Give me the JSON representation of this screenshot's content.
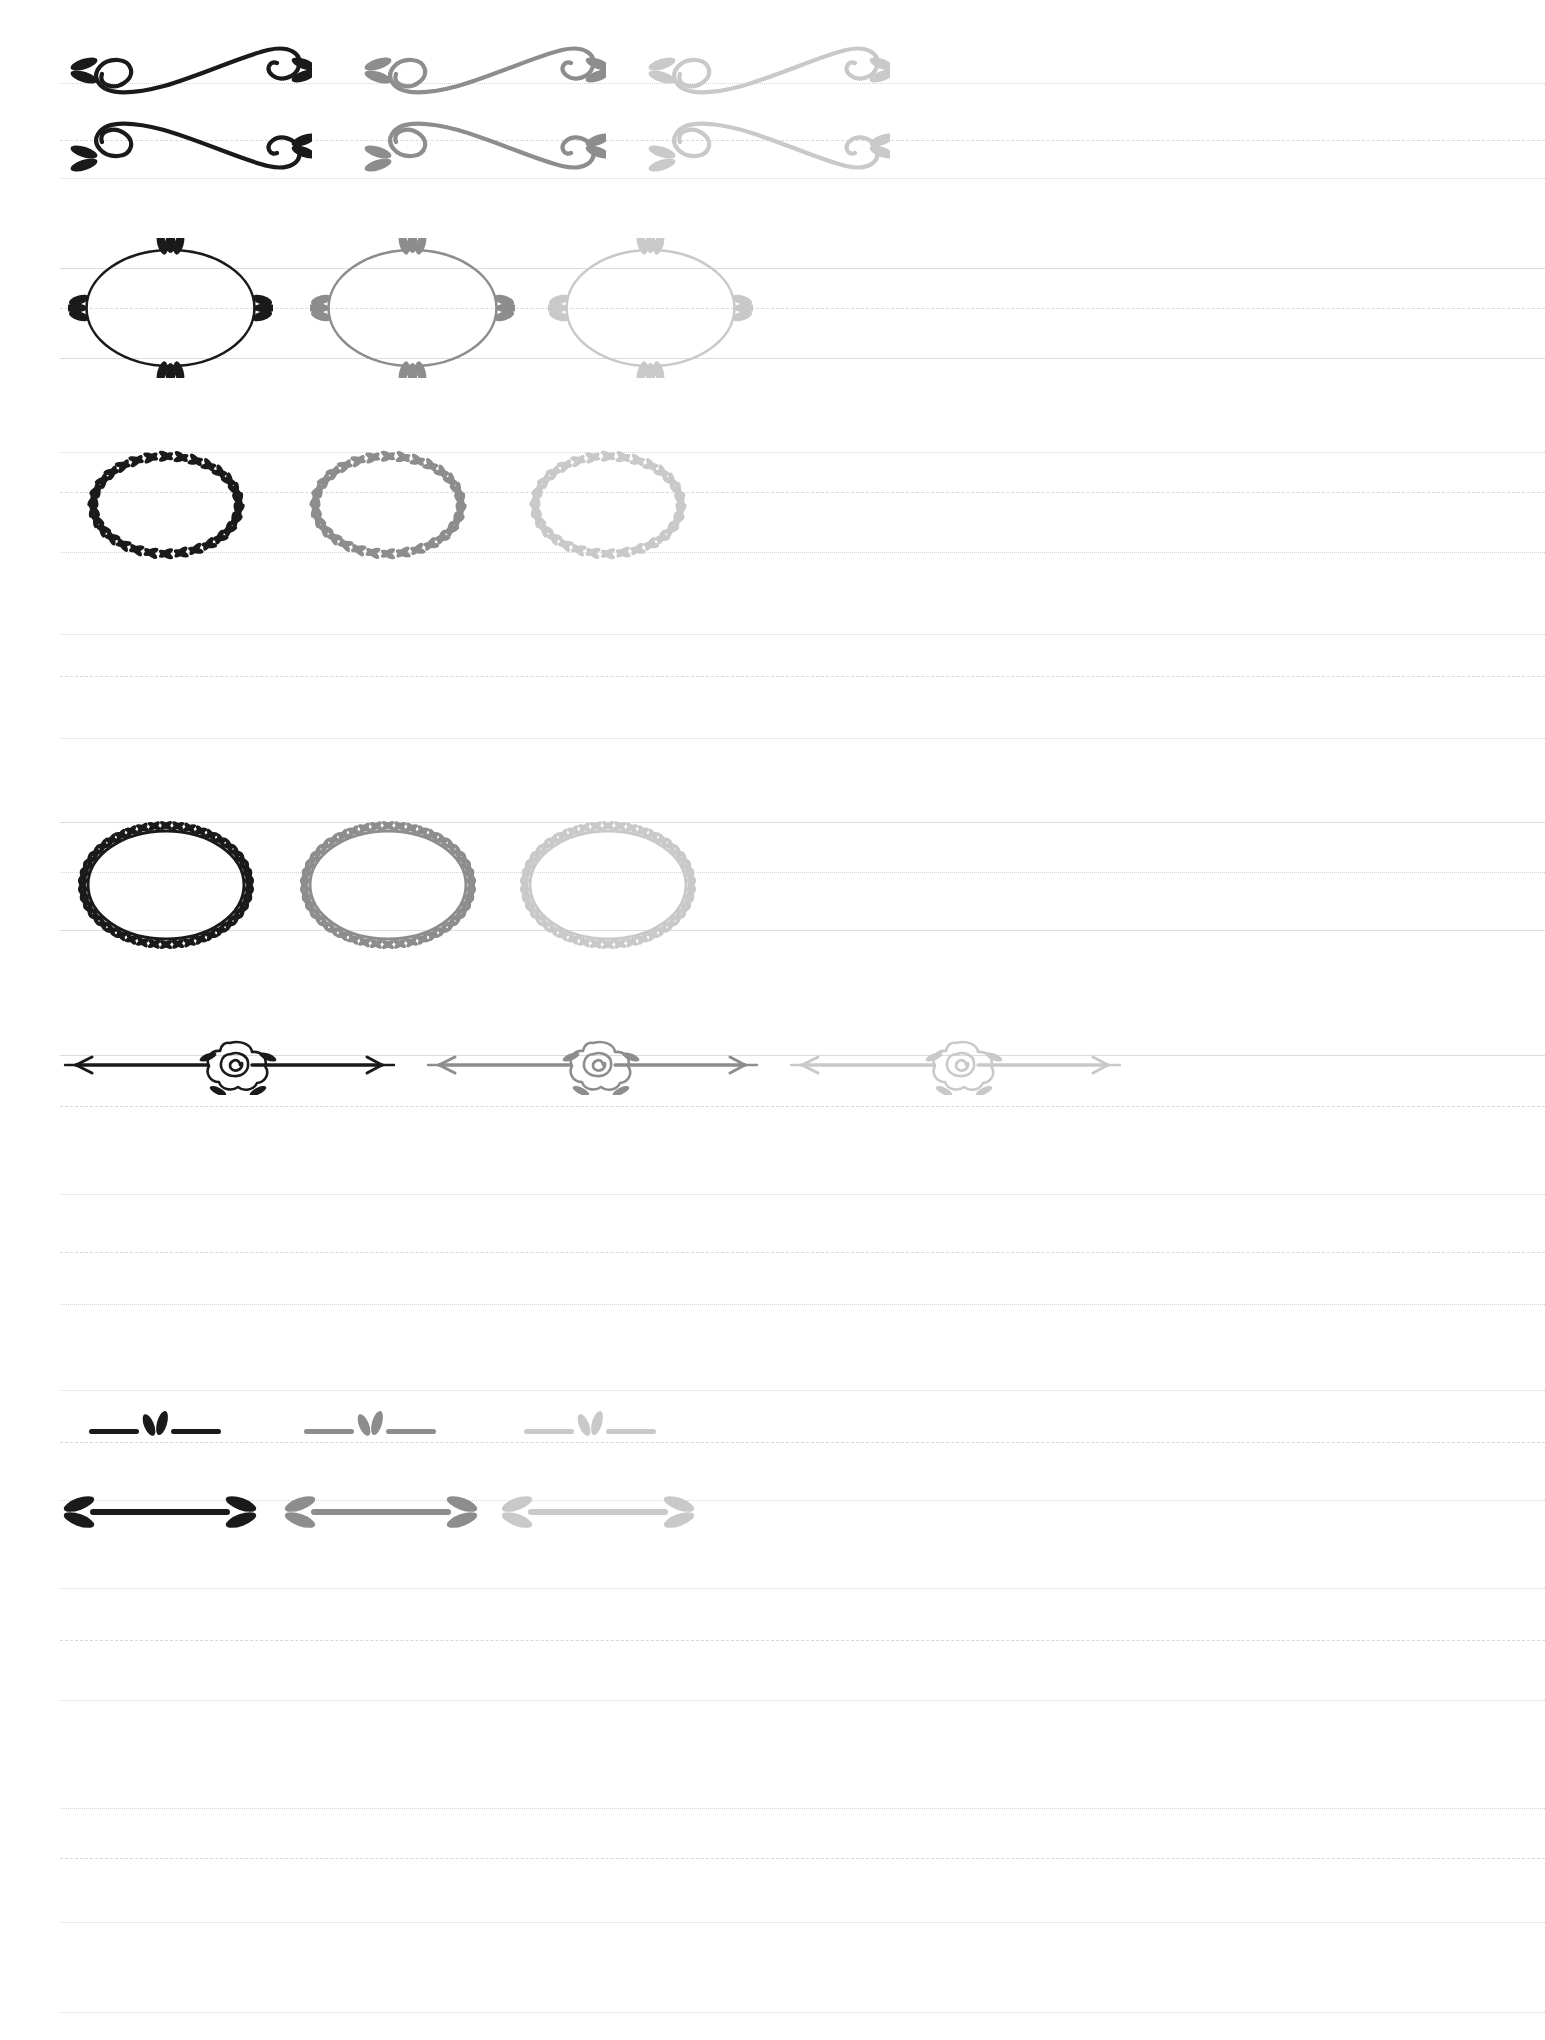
{
  "page": {
    "background_color": "#ffffff",
    "width": 1545,
    "height": 2040,
    "kind": "ornament-specimen-sheet"
  },
  "tones": {
    "dark": "#1a1a1a",
    "mid": "#8d8d8d",
    "light": "#c9c9c9",
    "tone_labels": [
      "dark",
      "mid",
      "light"
    ]
  },
  "ruled_lines": {
    "solid_color": "#dcdcdc",
    "dashed_color": "#d8d8d8",
    "dotted_color": "#d5d5d5",
    "left_margin": 60,
    "rows": [
      {
        "y": 83,
        "style": "dotted"
      },
      {
        "y": 140,
        "style": "dashed"
      },
      {
        "y": 178,
        "style": "dotted"
      },
      {
        "y": 268,
        "style": "solid"
      },
      {
        "y": 308,
        "style": "dashed"
      },
      {
        "y": 358,
        "style": "solid"
      },
      {
        "y": 452,
        "style": "dotted"
      },
      {
        "y": 492,
        "style": "dashed"
      },
      {
        "y": 552,
        "style": "dotted"
      },
      {
        "y": 634,
        "style": "dotted"
      },
      {
        "y": 676,
        "style": "dashed"
      },
      {
        "y": 738,
        "style": "dotted"
      },
      {
        "y": 822,
        "style": "solid"
      },
      {
        "y": 872,
        "style": "dotted"
      },
      {
        "y": 930,
        "style": "solid"
      },
      {
        "y": 1055,
        "style": "solid"
      },
      {
        "y": 1106,
        "style": "dashed"
      },
      {
        "y": 1194,
        "style": "dotted"
      },
      {
        "y": 1252,
        "style": "dashed"
      },
      {
        "y": 1304,
        "style": "dotted"
      },
      {
        "y": 1390,
        "style": "dotted"
      },
      {
        "y": 1442,
        "style": "dashed"
      },
      {
        "y": 1500,
        "style": "dotted"
      },
      {
        "y": 1588,
        "style": "dotted"
      },
      {
        "y": 1640,
        "style": "dashed"
      },
      {
        "y": 1700,
        "style": "dotted"
      },
      {
        "y": 1808,
        "style": "dotted"
      },
      {
        "y": 1858,
        "style": "dashed"
      },
      {
        "y": 1922,
        "style": "dotted"
      },
      {
        "y": 2012,
        "style": "dotted"
      }
    ]
  },
  "ornaments": [
    {
      "id": "swash-flourish-1",
      "name": "leafed-swash-flourish",
      "description": "S-curve calligraphic swash with leaf sprigs at both ends, left curl up",
      "row": 1,
      "y": 28,
      "variants": [
        {
          "tone": "dark",
          "x": 62,
          "width": 250,
          "height": 70
        },
        {
          "tone": "mid",
          "x": 356,
          "width": 250,
          "height": 70
        },
        {
          "tone": "light",
          "x": 640,
          "width": 250,
          "height": 70
        }
      ]
    },
    {
      "id": "swash-flourish-2",
      "name": "leafed-swash-flourish-mirrored",
      "description": "S-curve calligraphic swash mirrored vertically, leaf sprigs both ends",
      "row": 2,
      "y": 118,
      "variants": [
        {
          "tone": "dark",
          "x": 62,
          "width": 250,
          "height": 70
        },
        {
          "tone": "mid",
          "x": 356,
          "width": 250,
          "height": 70
        },
        {
          "tone": "light",
          "x": 640,
          "width": 250,
          "height": 70
        }
      ]
    },
    {
      "id": "oval-frame-leaf-tips",
      "name": "oval-frame-with-leaf-tips",
      "description": "Plain thin oval outline frame with three-leaf sprigs at top, bottom, left and right",
      "row": 3,
      "y": 238,
      "variants": [
        {
          "tone": "dark",
          "x": 68,
          "width": 205,
          "height": 140
        },
        {
          "tone": "mid",
          "x": 310,
          "width": 205,
          "height": 140
        },
        {
          "tone": "light",
          "x": 548,
          "width": 205,
          "height": 140
        }
      ]
    },
    {
      "id": "laurel-oval-sparse",
      "name": "laurel-wreath-oval-sparse",
      "description": "Open oval wreath of loose paired leaves, sparse spacing, no connecting stem",
      "row": 4,
      "y": 440,
      "variants": [
        {
          "tone": "dark",
          "x": 66,
          "width": 200,
          "height": 130
        },
        {
          "tone": "mid",
          "x": 288,
          "width": 200,
          "height": 130
        },
        {
          "tone": "light",
          "x": 508,
          "width": 200,
          "height": 130
        }
      ]
    },
    {
      "id": "laurel-oval-dense",
      "name": "laurel-wreath-oval-dense",
      "description": "Closed oval vine wreath with continuous stem and dense paired leaves",
      "row": 5,
      "y": 820,
      "variants": [
        {
          "tone": "dark",
          "x": 66,
          "width": 200,
          "height": 130
        },
        {
          "tone": "mid",
          "x": 288,
          "width": 200,
          "height": 130
        },
        {
          "tone": "light",
          "x": 508,
          "width": 200,
          "height": 130
        }
      ]
    },
    {
      "id": "rose-arrow-divider",
      "name": "rose-arrow-divider",
      "description": "Horizontal double arrow rule with a hand drawn spiral rose and leaves centered",
      "row": 6,
      "y": 1035,
      "variants": [
        {
          "tone": "dark",
          "x": 62,
          "width": 335,
          "height": 60
        },
        {
          "tone": "mid",
          "x": 425,
          "width": 335,
          "height": 60
        },
        {
          "tone": "light",
          "x": 788,
          "width": 335,
          "height": 60
        }
      ]
    },
    {
      "id": "leaf-pair-short-divider",
      "name": "leaf-pair-short-divider",
      "description": "Short broken rule with a two-leaf sprig in the middle gap",
      "row": 7,
      "y": 1408,
      "variants": [
        {
          "tone": "dark",
          "x": 85,
          "width": 140,
          "height": 40
        },
        {
          "tone": "mid",
          "x": 300,
          "width": 140,
          "height": 40
        },
        {
          "tone": "light",
          "x": 520,
          "width": 140,
          "height": 40
        }
      ]
    },
    {
      "id": "leaf-tipped-bar-divider",
      "name": "leaf-tipped-bar-divider",
      "description": "Thick horizontal bar terminating in double leaf fletching at both ends",
      "row": 8,
      "y": 1490,
      "variants": [
        {
          "tone": "dark",
          "x": 62,
          "width": 195,
          "height": 44
        },
        {
          "tone": "mid",
          "x": 283,
          "width": 195,
          "height": 44
        },
        {
          "tone": "light",
          "x": 500,
          "width": 195,
          "height": 44
        }
      ]
    }
  ]
}
